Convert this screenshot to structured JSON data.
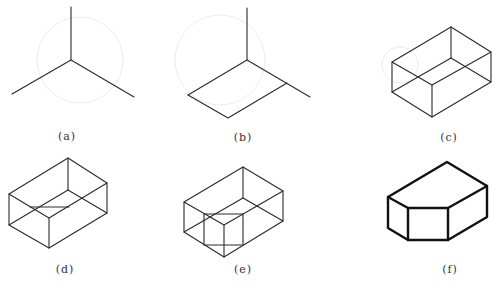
{
  "figure": {
    "panels": [
      {
        "id": "a",
        "label": "(a)",
        "description": "Isometric axes"
      },
      {
        "id": "b",
        "label": "(b)",
        "description": "Base rhombus on axes"
      },
      {
        "id": "c",
        "label": "(c)",
        "description": "Wireframe rectangular box"
      },
      {
        "id": "d",
        "label": "(d)",
        "description": "Box with cut line on top"
      },
      {
        "id": "e",
        "label": "(e)",
        "description": "Box with cut-out block outlined"
      },
      {
        "id": "f",
        "label": "(f)",
        "description": "Final solid with corner removed"
      }
    ],
    "colors": {
      "line": "#2a2a2a",
      "bold_line": "#111111",
      "background": "#ffffff"
    }
  }
}
